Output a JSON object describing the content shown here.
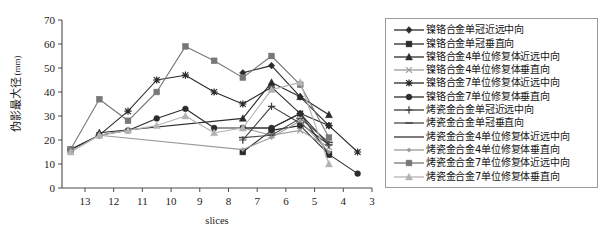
{
  "chart_data": {
    "type": "line",
    "title": "",
    "xlabel": "slices",
    "ylabel": "伪影最大径(mm)",
    "ylabel_main": "伪影最大径",
    "ylabel_unit": "(mm)",
    "xlim": [
      13.8,
      3.0
    ],
    "ylim": [
      0,
      70
    ],
    "x_reversed": true,
    "grid": false,
    "legend_position": "right-outside",
    "xticks": [
      13,
      12,
      11,
      10,
      9,
      8,
      7,
      6,
      5,
      4,
      3
    ],
    "yticks": [
      0,
      10,
      20,
      30,
      40,
      50,
      60,
      70
    ],
    "x": [
      13.5,
      12.5,
      11.5,
      10.5,
      9.5,
      8.5,
      7.5,
      6.5,
      5.5,
      4.5,
      3.5
    ],
    "series": [
      {
        "name": "镍铬合金单冠近远中向",
        "marker": "diamond",
        "color": "#2b2b2b",
        "values": [
          null,
          null,
          null,
          null,
          null,
          null,
          48,
          51,
          38,
          26,
          null
        ]
      },
      {
        "name": "镍铬合金单冠垂直向",
        "marker": "square",
        "color": "#2b2b2b",
        "values": [
          null,
          null,
          null,
          null,
          null,
          null,
          15,
          24,
          26,
          14,
          null
        ]
      },
      {
        "name": "镍铬合金4单位修复体近远中向",
        "marker": "triangle",
        "color": "#2b2b2b",
        "values": [
          null,
          23,
          null,
          null,
          null,
          null,
          29,
          44,
          38,
          30.5,
          null
        ]
      },
      {
        "name": "镍铬合金4单位修复体垂直向",
        "marker": "cross-x",
        "color": "#9a9a9a",
        "values": [
          null,
          null,
          null,
          null,
          null,
          null,
          25,
          22,
          24,
          17,
          null
        ]
      },
      {
        "name": "镍铬合金7单位修复体近远中向",
        "marker": "asterisk",
        "color": "#2b2b2b",
        "values": [
          16,
          22,
          32,
          45,
          47,
          40,
          35,
          42,
          31,
          26,
          15
        ]
      },
      {
        "name": "镍铬合金7单位修复体垂直向",
        "marker": "circle",
        "color": "#2b2b2b",
        "values": [
          16,
          22,
          24,
          29,
          33,
          25,
          25,
          25,
          31,
          14,
          6
        ]
      },
      {
        "name": "烤瓷金合金单冠近远中向",
        "marker": "plus",
        "color": "#3a3a3a",
        "values": [
          null,
          null,
          null,
          null,
          null,
          null,
          20,
          34,
          27,
          18,
          null
        ]
      },
      {
        "name": "烤瓷金合金单冠垂直向",
        "marker": "dash",
        "color": "#4a4a4a",
        "values": [
          null,
          null,
          null,
          null,
          null,
          null,
          21,
          22,
          29,
          19,
          null
        ]
      },
      {
        "name": "烤瓷金合金4单位修复体近远中向",
        "marker": "line",
        "color": "#333333",
        "values": [
          null,
          null,
          null,
          null,
          null,
          null,
          25,
          25,
          31,
          18,
          null
        ]
      },
      {
        "name": "烤瓷金合金4单位修复体垂直向",
        "marker": "small-diamond",
        "color": "#9a9a9a",
        "values": [
          15,
          22,
          null,
          null,
          null,
          null,
          16,
          21,
          28,
          15,
          null
        ]
      },
      {
        "name": "烤瓷金合金7单位修复体近远中向",
        "marker": "square",
        "color": "#777777",
        "values": [
          16,
          37,
          28,
          40,
          59,
          53,
          46,
          55,
          43,
          21,
          null
        ]
      },
      {
        "name": "烤瓷金合金7单位修复体垂直向",
        "marker": "triangle",
        "color": "#b3b3b3",
        "values": [
          15,
          22,
          24,
          26,
          30,
          23,
          25,
          41,
          44,
          10,
          null
        ]
      }
    ]
  },
  "legend": {
    "items": [
      {
        "label": "镍铬合金单冠近远中向"
      },
      {
        "label": "镍铬合金单冠垂直向"
      },
      {
        "label": "镍铬合金4单位修复体近远中向"
      },
      {
        "label": "镍铬合金4单位修复体垂直向"
      },
      {
        "label": "镍铬合金7单位修复体近远中向"
      },
      {
        "label": "镍铬合金7单位修复体垂直向"
      },
      {
        "label": "烤瓷金合金单冠近远中向"
      },
      {
        "label": "烤瓷金合金单冠垂直向"
      },
      {
        "label": "烤瓷金合金4单位修复体近远中向"
      },
      {
        "label": "烤瓷金合金4单位修复体垂直向"
      },
      {
        "label": "烤瓷金合金7单位修复体近远中向"
      },
      {
        "label": "烤瓷金合金7单位修复体垂直向"
      }
    ]
  },
  "colors": {
    "axis": "#4a4a4a",
    "dark": "#2b2b2b",
    "mid": "#777777",
    "light": "#b3b3b3",
    "legend_border": "#9a9a9a",
    "background": "#ffffff"
  }
}
